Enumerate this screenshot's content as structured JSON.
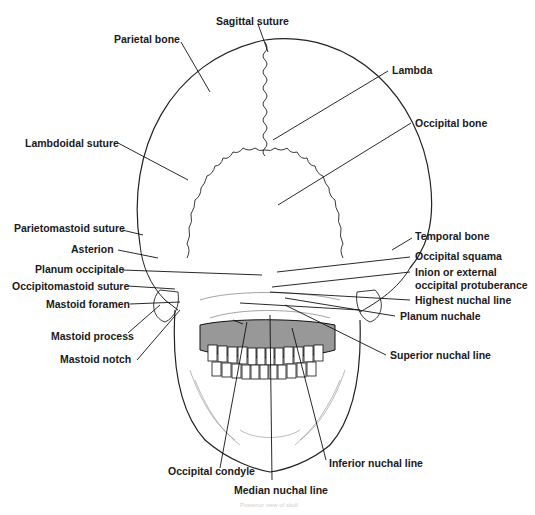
{
  "figure": {
    "caption": "Posterior view of skull"
  },
  "labels": {
    "sagittal_suture": "Sagittal suture",
    "parietal_bone": "Parietal bone",
    "lambda": "Lambda",
    "occipital_bone": "Occipital bone",
    "lambdoidal_suture": "Lambdoidal suture",
    "parietomastoid_suture": "Parietomastoid suture",
    "asterion": "Asterion",
    "planum_occipitale": "Planum occipitale",
    "occipitomastoid_suture": "Occipitomastoid suture",
    "mastoid_foramen": "Mastoid foramen",
    "mastoid_process": "Mastoid process",
    "mastoid_notch": "Mastoid notch",
    "temporal_bone": "Temporal bone",
    "occipital_squama": "Occipital squama",
    "inion_line1": "Inion or external",
    "inion_line2": "occipital protuberance",
    "highest_nuchal_line": "Highest nuchal line",
    "planum_nuchale": "Planum nuchale",
    "superior_nuchal_line": "Superior nuchal line",
    "occipital_condyle": "Occipital condyle",
    "inferior_nuchal_line": "Inferior nuchal line",
    "median_nuchal_line": "Median nuchal line"
  },
  "colors": {
    "ink": "#1a1a1a",
    "background": "#ffffff"
  }
}
